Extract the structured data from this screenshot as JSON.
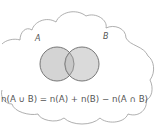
{
  "diagram": {
    "type": "venn",
    "sets": [
      {
        "label": "A",
        "fill": "#d4d4d4"
      },
      {
        "label": "B",
        "fill": "#d4d4d4"
      }
    ],
    "intersection_fill": "#cacaca",
    "outline_color": "#666666",
    "cloud_outline_color": "#999999",
    "formula": "n(A ∪ B) = n(A) + n(B) − n(A ∩ B)"
  }
}
